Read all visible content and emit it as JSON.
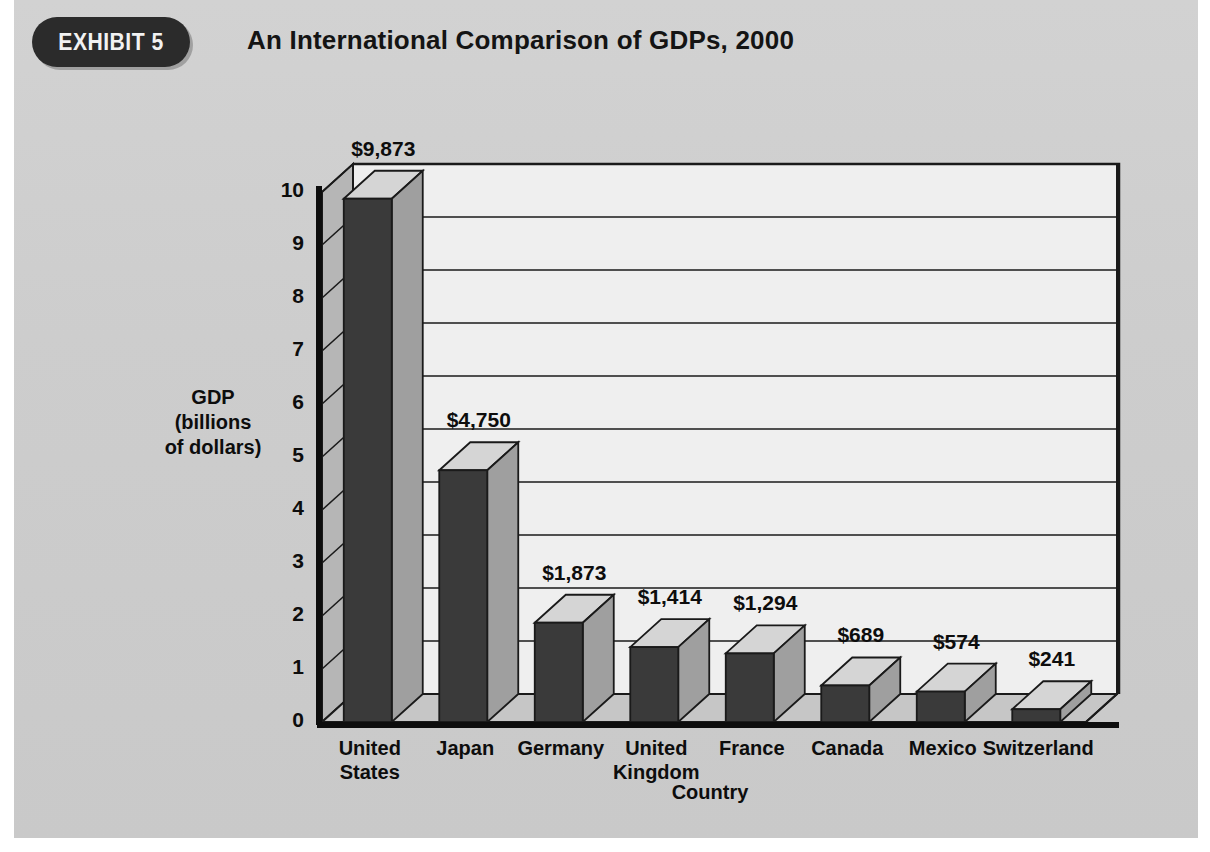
{
  "header": {
    "badge": "EXHIBIT 5",
    "title": "An International Comparison of GDPs, 2000"
  },
  "chart_data": {
    "type": "bar",
    "title": "An International Comparison of GDPs, 2000",
    "xlabel": "Country",
    "ylabel": "GDP (billions of dollars)",
    "ylabel_lines": [
      "GDP",
      "(billions",
      "of dollars)"
    ],
    "categories": [
      "United States",
      "Japan",
      "Germany",
      "United Kingdom",
      "France",
      "Canada",
      "Mexico",
      "Switzerland"
    ],
    "category_lines": [
      [
        "United",
        "States"
      ],
      [
        "Japan"
      ],
      [
        "Germany"
      ],
      [
        "United",
        "Kingdom"
      ],
      [
        "France"
      ],
      [
        "Canada"
      ],
      [
        "Mexico"
      ],
      [
        "Switzerland"
      ]
    ],
    "values": [
      9.873,
      4.75,
      1.873,
      1.414,
      1.294,
      0.689,
      0.574,
      0.241
    ],
    "data_labels": [
      "$9,873",
      "$4,750",
      "$1,873",
      "$1,414",
      "$1,294",
      "$689",
      "$574",
      "$241"
    ],
    "value_units": "billions of dollars",
    "ylim": [
      0,
      10
    ],
    "yticks": [
      0,
      1,
      2,
      3,
      4,
      5,
      6,
      7,
      8,
      9,
      10
    ],
    "ytick_labels": [
      "0",
      "1",
      "2",
      "3",
      "4",
      "5",
      "6",
      "7",
      "8",
      "9",
      "10"
    ],
    "grid": true,
    "legend": null,
    "style": "3d-column",
    "colors": {
      "bar_front": "#3a3a3a",
      "bar_side": "#9f9f9f",
      "bar_top": "#d5d5d5",
      "plot_background": "#efefef",
      "wall_side": "#b6b6b6",
      "floor": "#c6c6c6",
      "page_background": "#cdcdcd",
      "axis": "#111111",
      "badge_background": "#2b2b2b",
      "text": "#0d0d0d"
    }
  }
}
